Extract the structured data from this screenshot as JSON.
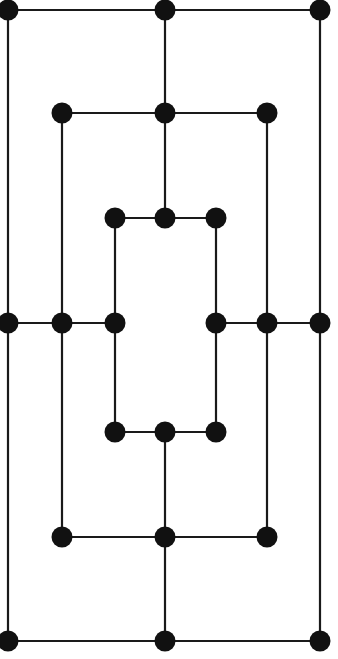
{
  "figure": {
    "width": 338,
    "height": 659,
    "background_color": "#ffffff"
  },
  "style": {
    "node_color": "#111111",
    "node_radius": 10.5,
    "edge_color": "#1a1a1a",
    "edge_width": 2.2,
    "node_count_label": "30",
    "edge_count_label": "33"
  },
  "chart_data": {
    "type": "scatter",
    "xlabel": "",
    "ylabel": "",
    "xlim": [
      0,
      338
    ],
    "ylim": [
      0,
      659
    ],
    "grid": false,
    "legend": "none",
    "columns_x": [
      8,
      62,
      115,
      165,
      216,
      267,
      320
    ],
    "rows_y": [
      10,
      113,
      218,
      323,
      432,
      537,
      641
    ],
    "nodes": [
      {
        "id": "n1",
        "x": 8,
        "y": 10,
        "ring": "outer",
        "label": ""
      },
      {
        "id": "n2",
        "x": 165,
        "y": 10,
        "ring": "outer",
        "label": ""
      },
      {
        "id": "n3",
        "x": 320,
        "y": 10,
        "ring": "outer",
        "label": ""
      },
      {
        "id": "n4",
        "x": 62,
        "y": 113,
        "ring": "second",
        "label": ""
      },
      {
        "id": "n5",
        "x": 165,
        "y": 113,
        "ring": "second",
        "label": ""
      },
      {
        "id": "n6",
        "x": 267,
        "y": 113,
        "ring": "second",
        "label": ""
      },
      {
        "id": "n7",
        "x": 115,
        "y": 218,
        "ring": "third",
        "label": ""
      },
      {
        "id": "n8",
        "x": 165,
        "y": 218,
        "ring": "third",
        "label": ""
      },
      {
        "id": "n9",
        "x": 216,
        "y": 218,
        "ring": "third",
        "label": ""
      },
      {
        "id": "n10",
        "x": 8,
        "y": 323,
        "ring": "middle",
        "label": ""
      },
      {
        "id": "n11",
        "x": 62,
        "y": 323,
        "ring": "middle",
        "label": ""
      },
      {
        "id": "n12",
        "x": 115,
        "y": 323,
        "ring": "middle",
        "label": ""
      },
      {
        "id": "n13",
        "x": 216,
        "y": 323,
        "ring": "middle",
        "label": ""
      },
      {
        "id": "n14",
        "x": 267,
        "y": 323,
        "ring": "middle",
        "label": ""
      },
      {
        "id": "n15",
        "x": 320,
        "y": 323,
        "ring": "middle",
        "label": ""
      },
      {
        "id": "n16",
        "x": 115,
        "y": 432,
        "ring": "third",
        "label": ""
      },
      {
        "id": "n17",
        "x": 165,
        "y": 432,
        "ring": "third",
        "label": ""
      },
      {
        "id": "n18",
        "x": 216,
        "y": 432,
        "ring": "third",
        "label": ""
      },
      {
        "id": "n19",
        "x": 62,
        "y": 537,
        "ring": "second",
        "label": ""
      },
      {
        "id": "n20",
        "x": 165,
        "y": 537,
        "ring": "second",
        "label": ""
      },
      {
        "id": "n21",
        "x": 267,
        "y": 537,
        "ring": "second",
        "label": ""
      },
      {
        "id": "n22",
        "x": 8,
        "y": 641,
        "ring": "outer",
        "label": ""
      },
      {
        "id": "n23",
        "x": 165,
        "y": 641,
        "ring": "outer",
        "label": ""
      },
      {
        "id": "n24",
        "x": 320,
        "y": 641,
        "ring": "outer",
        "label": ""
      }
    ],
    "edges": [
      {
        "from": "n1",
        "to": "n2",
        "orientation": "horizontal"
      },
      {
        "from": "n2",
        "to": "n3",
        "orientation": "horizontal"
      },
      {
        "from": "n4",
        "to": "n5",
        "orientation": "horizontal"
      },
      {
        "from": "n5",
        "to": "n6",
        "orientation": "horizontal"
      },
      {
        "from": "n7",
        "to": "n8",
        "orientation": "horizontal"
      },
      {
        "from": "n8",
        "to": "n9",
        "orientation": "horizontal"
      },
      {
        "from": "n10",
        "to": "n11",
        "orientation": "horizontal"
      },
      {
        "from": "n11",
        "to": "n12",
        "orientation": "horizontal"
      },
      {
        "from": "n13",
        "to": "n14",
        "orientation": "horizontal"
      },
      {
        "from": "n14",
        "to": "n15",
        "orientation": "horizontal"
      },
      {
        "from": "n16",
        "to": "n17",
        "orientation": "horizontal"
      },
      {
        "from": "n17",
        "to": "n18",
        "orientation": "horizontal"
      },
      {
        "from": "n19",
        "to": "n20",
        "orientation": "horizontal"
      },
      {
        "from": "n20",
        "to": "n21",
        "orientation": "horizontal"
      },
      {
        "from": "n22",
        "to": "n23",
        "orientation": "horizontal"
      },
      {
        "from": "n23",
        "to": "n24",
        "orientation": "horizontal"
      },
      {
        "from": "n1",
        "to": "n10",
        "orientation": "vertical"
      },
      {
        "from": "n10",
        "to": "n22",
        "orientation": "vertical"
      },
      {
        "from": "n3",
        "to": "n15",
        "orientation": "vertical"
      },
      {
        "from": "n15",
        "to": "n24",
        "orientation": "vertical"
      },
      {
        "from": "n2",
        "to": "n5",
        "orientation": "vertical"
      },
      {
        "from": "n5",
        "to": "n8",
        "orientation": "vertical"
      },
      {
        "from": "n17",
        "to": "n20",
        "orientation": "vertical"
      },
      {
        "from": "n20",
        "to": "n23",
        "orientation": "vertical"
      },
      {
        "from": "n4",
        "to": "n11",
        "orientation": "vertical"
      },
      {
        "from": "n11",
        "to": "n19",
        "orientation": "vertical"
      },
      {
        "from": "n6",
        "to": "n14",
        "orientation": "vertical"
      },
      {
        "from": "n14",
        "to": "n21",
        "orientation": "vertical"
      },
      {
        "from": "n7",
        "to": "n12",
        "orientation": "vertical"
      },
      {
        "from": "n12",
        "to": "n16",
        "orientation": "vertical"
      },
      {
        "from": "n9",
        "to": "n13",
        "orientation": "vertical"
      },
      {
        "from": "n13",
        "to": "n18",
        "orientation": "vertical"
      }
    ]
  }
}
